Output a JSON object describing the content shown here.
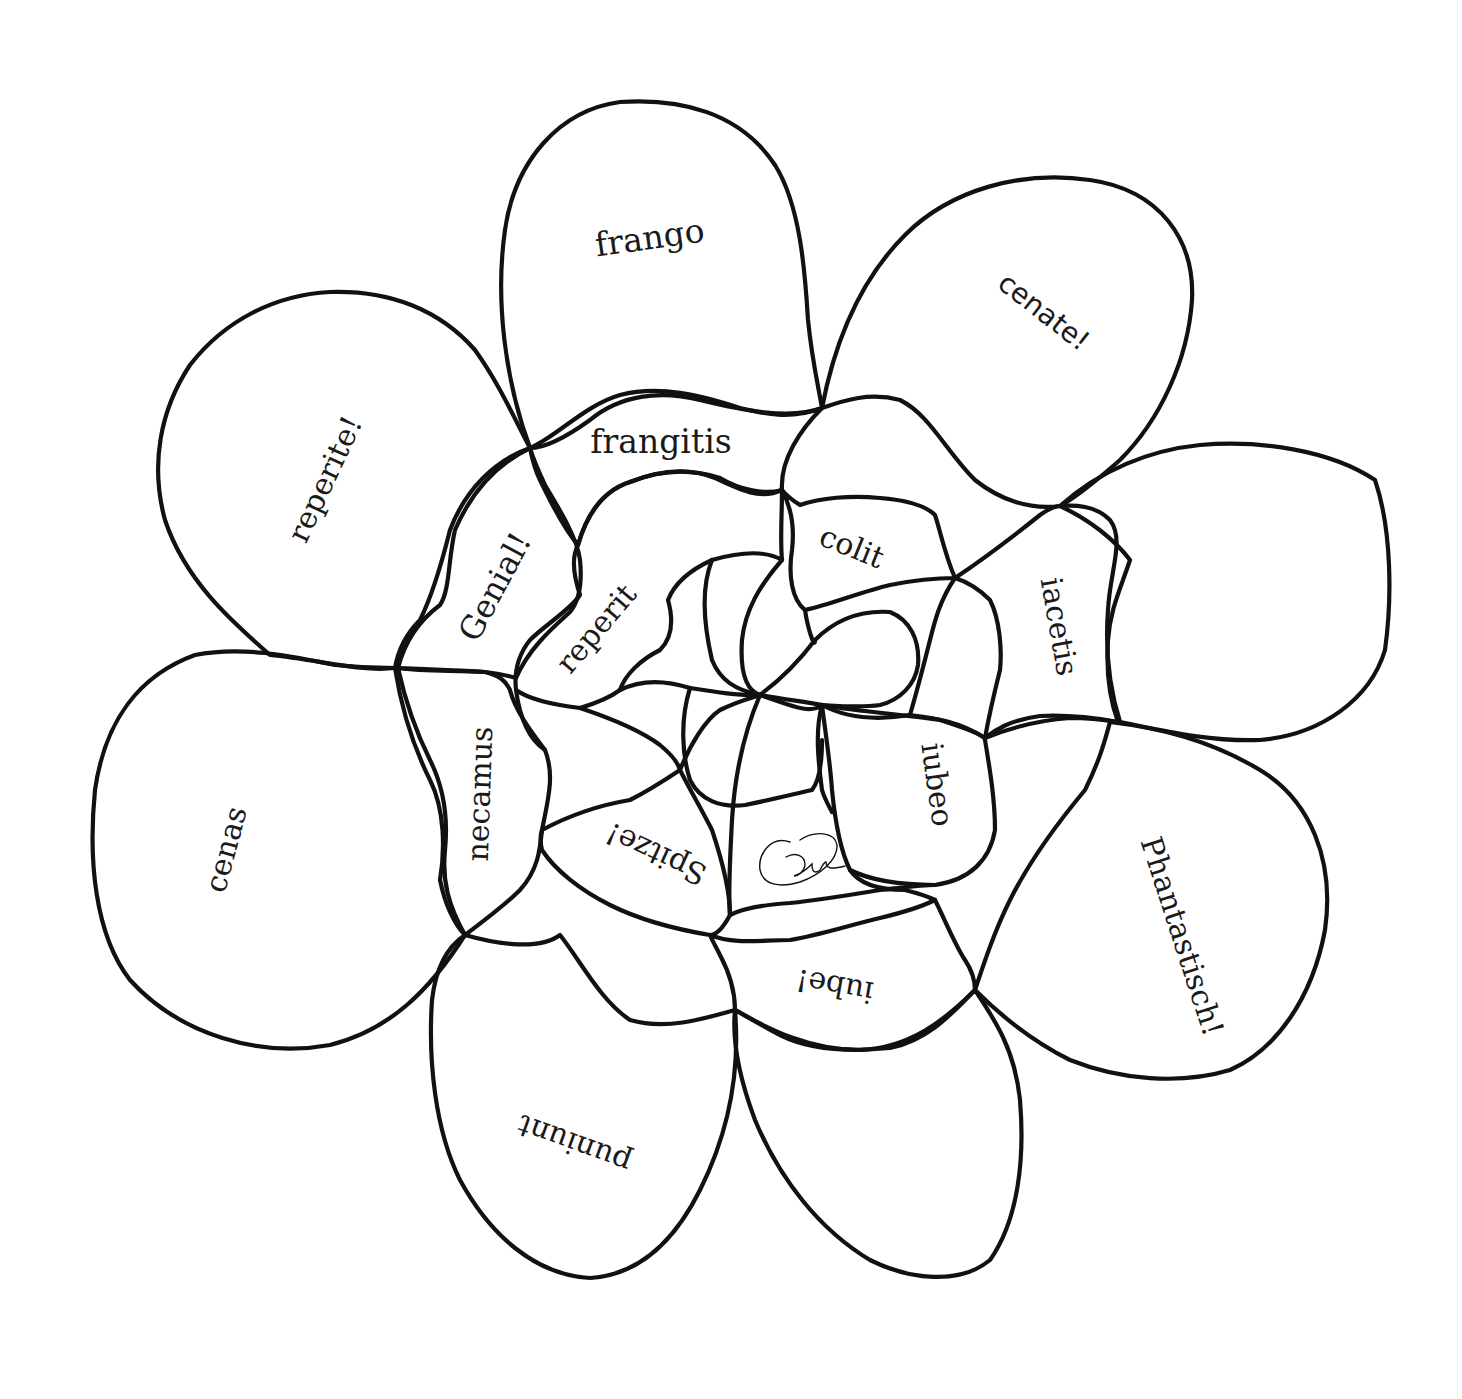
{
  "diagram": {
    "type": "word-flower",
    "colors": {
      "background": "#ffffff",
      "line": "#111111",
      "text": "#1a1a1a"
    },
    "outer_petals": [
      {
        "id": "top",
        "label": "frango",
        "rotation": -8
      },
      {
        "id": "top-right",
        "label": "cenate!",
        "rotation": 38
      },
      {
        "id": "right",
        "label": "",
        "rotation": 0
      },
      {
        "id": "lower-right",
        "label": "Phantastisch!",
        "rotation": 72
      },
      {
        "id": "bottom-right",
        "label": "",
        "rotation": 0
      },
      {
        "id": "bottom-left",
        "label": "puniunt",
        "rotation": 200
      },
      {
        "id": "left",
        "label": "cenas",
        "rotation": -75
      },
      {
        "id": "upper-left",
        "label": "reperite!",
        "rotation": -65
      }
    ],
    "middle_petals": [
      {
        "id": "frangitis",
        "label": "frangitis",
        "rotation": 0
      },
      {
        "id": "colit",
        "label": "colit",
        "rotation": 22
      },
      {
        "id": "iacetis",
        "label": "iacetis",
        "rotation": 80
      },
      {
        "id": "iube",
        "label": "iube!",
        "rotation": 190
      },
      {
        "id": "necamus",
        "label": "necamus",
        "rotation": -88
      },
      {
        "id": "genial",
        "label": "Genial!",
        "rotation": -62
      }
    ],
    "inner_petals": [
      {
        "id": "reperit",
        "label": "reperit",
        "rotation": -50
      },
      {
        "id": "iubeo",
        "label": "iubeo",
        "rotation": 82
      },
      {
        "id": "spitze",
        "label": "Spitze!",
        "rotation": 205
      }
    ],
    "center_mark": {
      "type": "signature",
      "label": "signature-glyph"
    }
  }
}
